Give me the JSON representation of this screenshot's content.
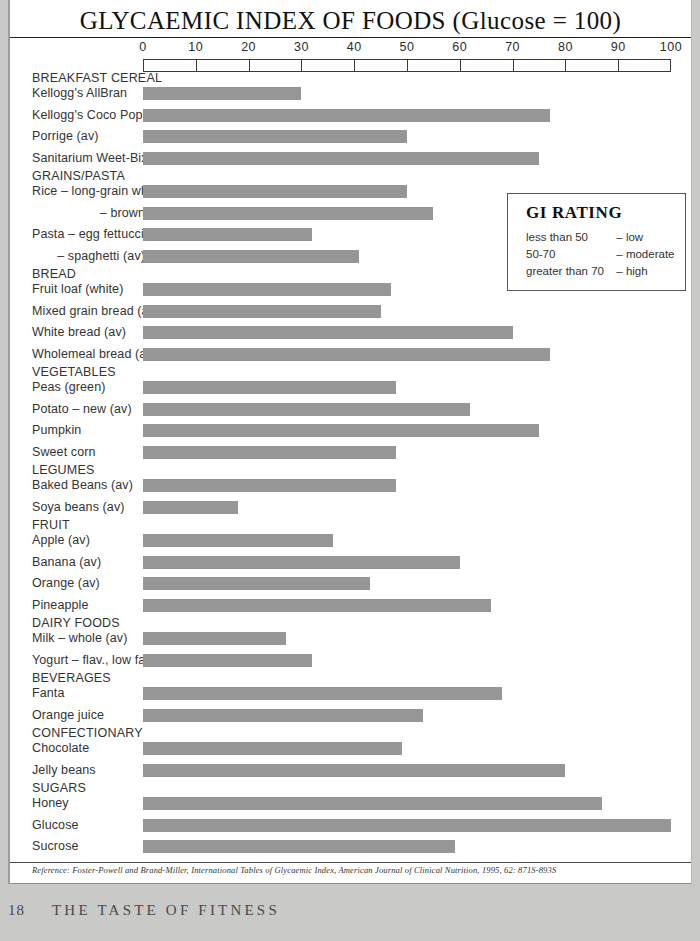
{
  "title": "GLYCAEMIC INDEX OF FOODS (Glucose = 100)",
  "axis": {
    "ticks": [
      "0",
      "10",
      "20",
      "30",
      "40",
      "50",
      "60",
      "70",
      "80",
      "90",
      "100"
    ],
    "min": 0,
    "max": 100
  },
  "gi_rating": {
    "heading": "GI RATING",
    "rows": [
      {
        "condition": "less than 50",
        "rating": "– low"
      },
      {
        "condition": "50-70",
        "rating": "– moderate"
      },
      {
        "condition": "greater than 70",
        "rating": "– high"
      }
    ]
  },
  "reference": "Reference: Foster-Powell and Brand-Miller, International Tables of Glycaemic Index, American Journal of Clinical Nutrition, 1995, 62: 871S-893S",
  "footer": {
    "folio": "18",
    "book_title": "THE TASTE OF FITNESS"
  },
  "colors": {
    "bar": "#969696",
    "ink": "#333333",
    "rule": "#3a3a3a",
    "paper": "#ffffff"
  },
  "chart_data": {
    "type": "bar",
    "title": "GLYCAEMIC INDEX OF FOODS (Glucose = 100)",
    "xlabel": "",
    "ylabel": "",
    "xlim": [
      0,
      100
    ],
    "orientation": "horizontal",
    "grid": false,
    "legend": "GI RATING box, upper right",
    "xticks": [
      0,
      10,
      20,
      30,
      40,
      50,
      60,
      70,
      80,
      90,
      100
    ],
    "groups": [
      {
        "name": "BREAKFAST CEREAL",
        "items": [
          {
            "label": "Kellogg's AllBran",
            "value": 30,
            "indent": false
          },
          {
            "label": "Kellogg's Coco Pops",
            "value": 77,
            "indent": false
          },
          {
            "label": "Porrige (av)",
            "value": 50,
            "indent": false
          },
          {
            "label": "Sanitarium Weet-Bix",
            "value": 75,
            "indent": false
          }
        ]
      },
      {
        "name": "GRAINS/PASTA",
        "items": [
          {
            "label": "Rice – long-grain white",
            "value": 50,
            "indent": false
          },
          {
            "label": "– brown",
            "value": 55,
            "indent": true
          },
          {
            "label": "Pasta – egg fettuccine",
            "value": 32,
            "indent": false
          },
          {
            "label": "– spaghetti (av)",
            "value": 41,
            "indent": true
          }
        ]
      },
      {
        "name": "BREAD",
        "items": [
          {
            "label": "Fruit loaf (white)",
            "value": 47,
            "indent": false
          },
          {
            "label": "Mixed grain bread (av)",
            "value": 45,
            "indent": false
          },
          {
            "label": "White bread (av)",
            "value": 70,
            "indent": false
          },
          {
            "label": "Wholemeal bread (av)",
            "value": 77,
            "indent": false
          }
        ]
      },
      {
        "name": "VEGETABLES",
        "items": [
          {
            "label": "Peas (green)",
            "value": 48,
            "indent": false
          },
          {
            "label": "Potato – new (av)",
            "value": 62,
            "indent": false
          },
          {
            "label": "Pumpkin",
            "value": 75,
            "indent": false
          },
          {
            "label": "Sweet corn",
            "value": 48,
            "indent": false
          }
        ]
      },
      {
        "name": "LEGUMES",
        "items": [
          {
            "label": "Baked Beans (av)",
            "value": 48,
            "indent": false
          },
          {
            "label": "Soya beans (av)",
            "value": 18,
            "indent": false
          }
        ]
      },
      {
        "name": "FRUIT",
        "items": [
          {
            "label": "Apple (av)",
            "value": 36,
            "indent": false
          },
          {
            "label": "Banana (av)",
            "value": 60,
            "indent": false
          },
          {
            "label": "Orange (av)",
            "value": 43,
            "indent": false
          },
          {
            "label": "Pineapple",
            "value": 66,
            "indent": false
          }
        ]
      },
      {
        "name": "DAIRY FOODS",
        "items": [
          {
            "label": "Milk – whole (av)",
            "value": 27,
            "indent": false
          },
          {
            "label": "Yogurt – flav., low fat",
            "value": 32,
            "indent": false
          }
        ]
      },
      {
        "name": "BEVERAGES",
        "items": [
          {
            "label": "Fanta",
            "value": 68,
            "indent": false
          },
          {
            "label": "Orange juice",
            "value": 53,
            "indent": false
          }
        ]
      },
      {
        "name": "CONFECTIONARY",
        "items": [
          {
            "label": "Chocolate",
            "value": 49,
            "indent": false
          },
          {
            "label": "Jelly beans",
            "value": 80,
            "indent": false
          }
        ]
      },
      {
        "name": "SUGARS",
        "items": [
          {
            "label": "Honey",
            "value": 87,
            "indent": false
          },
          {
            "label": "Glucose",
            "value": 100,
            "indent": false
          },
          {
            "label": "Sucrose",
            "value": 59,
            "indent": false
          }
        ]
      }
    ]
  }
}
